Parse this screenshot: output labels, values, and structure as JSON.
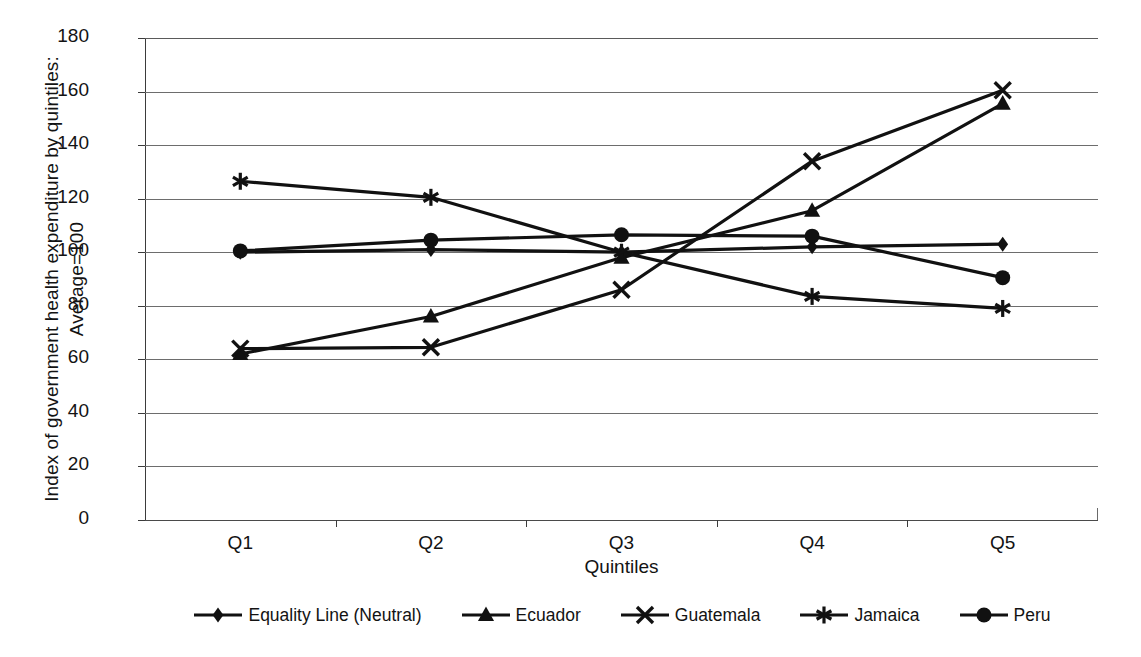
{
  "chart_data": {
    "type": "line",
    "title": "",
    "xlabel": "Quintiles",
    "ylabel": "Index of government health expenditure by quintiles: Average=100",
    "ylabel_line1": "Index of government health expenditure by quintiles:",
    "ylabel_line2": "Average=100",
    "categories": [
      "Q1",
      "Q2",
      "Q3",
      "Q4",
      "Q5"
    ],
    "ylim": [
      0,
      180
    ],
    "ytick_step": 20,
    "yticks": [
      0,
      20,
      40,
      60,
      80,
      100,
      120,
      140,
      160,
      180
    ],
    "grid": true,
    "legend_position": "bottom",
    "series": [
      {
        "name": "Equality Line (Neutral)",
        "marker": "diamond",
        "values": [
          100,
          101,
          100,
          102,
          103
        ]
      },
      {
        "name": "Ecuador",
        "marker": "triangle",
        "values": [
          62,
          76,
          98,
          115.5,
          155.5
        ]
      },
      {
        "name": "Guatemala",
        "marker": "x",
        "values": [
          64,
          64.5,
          86,
          134,
          160.5
        ]
      },
      {
        "name": "Jamaica",
        "marker": "asterisk",
        "values": [
          126.5,
          120.5,
          100,
          83.5,
          79
        ]
      },
      {
        "name": "Peru",
        "marker": "circle",
        "values": [
          100.5,
          104.5,
          106.5,
          106,
          90.5
        ]
      }
    ]
  },
  "colors": {
    "series_line": "#111111",
    "gridline": "#6d6d6d",
    "axis": "#3b3b3b",
    "background": "#ffffff"
  }
}
